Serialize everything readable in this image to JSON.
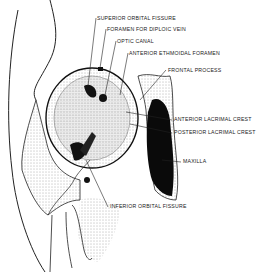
{
  "figure": {
    "labels": [
      {
        "id": "superior-orbital-fissure",
        "text": "SUPERIOR ORBITAL FISSURE",
        "x": 97,
        "y": 15
      },
      {
        "id": "foramen-for-diploic-vein",
        "text": "FORAMEN FOR DIPLOIC VEIN",
        "x": 107,
        "y": 26
      },
      {
        "id": "optic-canal",
        "text": "OPTIC CANAL",
        "x": 117,
        "y": 38
      },
      {
        "id": "anterior-ethmoidal-foramen",
        "text": "ANTERIOR ETHMOIDAL FORAMEN",
        "x": 129,
        "y": 50
      },
      {
        "id": "frontal-process",
        "text": "FRONTAL PROCESS",
        "x": 168,
        "y": 67
      },
      {
        "id": "anterior-lacrimal-crest",
        "text": "ANTERIOR LACRIMAL CREST",
        "x": 174,
        "y": 116
      },
      {
        "id": "posterior-lacrimal-crest",
        "text": "POSTERIOR LACRIMAL CREST",
        "x": 174,
        "y": 129
      },
      {
        "id": "maxilla",
        "text": "MAXILLA",
        "x": 183,
        "y": 158
      },
      {
        "id": "inferior-orbital-fissure",
        "text": "INFERIOR ORBITAL FISSURE",
        "x": 110,
        "y": 203
      }
    ]
  }
}
